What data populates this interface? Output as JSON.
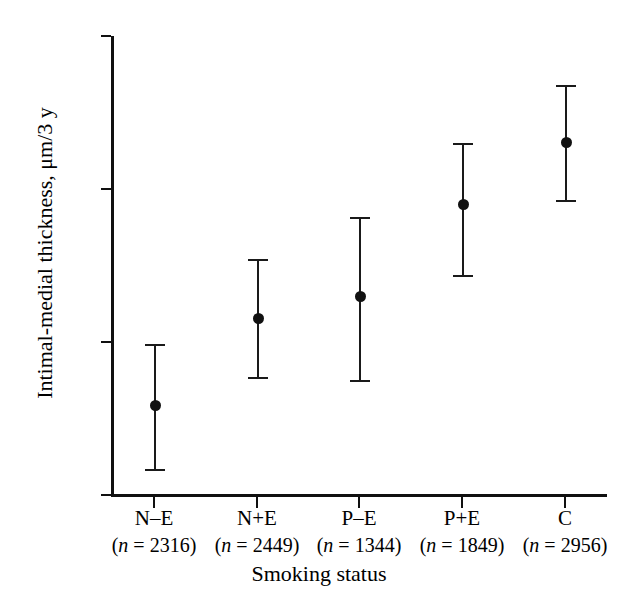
{
  "chart_data": {
    "type": "scatter",
    "title": "",
    "xlabel": "Smoking status",
    "ylabel": "Intimal-medial thickness, μm/3 y",
    "ylim": [
      20,
      50
    ],
    "yticks": [
      20,
      30,
      40,
      50
    ],
    "ytick_labels": [
      "20",
      "30",
      "40",
      "50"
    ],
    "grid": false,
    "legend": null,
    "categories": [
      "N–E",
      "N+E",
      "P–E",
      "P+E",
      "C"
    ],
    "category_counts": [
      2316,
      2449,
      1344,
      1849,
      2956
    ],
    "category_sublabels": [
      "(n = 2316)",
      "(n = 2449)",
      "(n = 1344)",
      "(n = 1849)",
      "(n = 2956)"
    ],
    "values": [
      25.9,
      31.6,
      33.0,
      39.0,
      43.1
    ],
    "error_low": [
      21.7,
      27.7,
      27.5,
      34.4,
      39.3
    ],
    "error_high": [
      29.9,
      35.4,
      38.2,
      43.0,
      46.8
    ],
    "marker": "filled-circle",
    "series": [
      {
        "name": "Intimal-medial thickness",
        "values": [
          25.9,
          31.6,
          33.0,
          39.0,
          43.1
        ],
        "error_low": [
          21.7,
          27.7,
          27.5,
          34.4,
          39.3
        ],
        "error_high": [
          29.9,
          35.4,
          38.2,
          43.0,
          46.8
        ]
      }
    ]
  },
  "colors": {
    "ink": "#101010",
    "background": "#ffffff",
    "marker": "#111111"
  }
}
